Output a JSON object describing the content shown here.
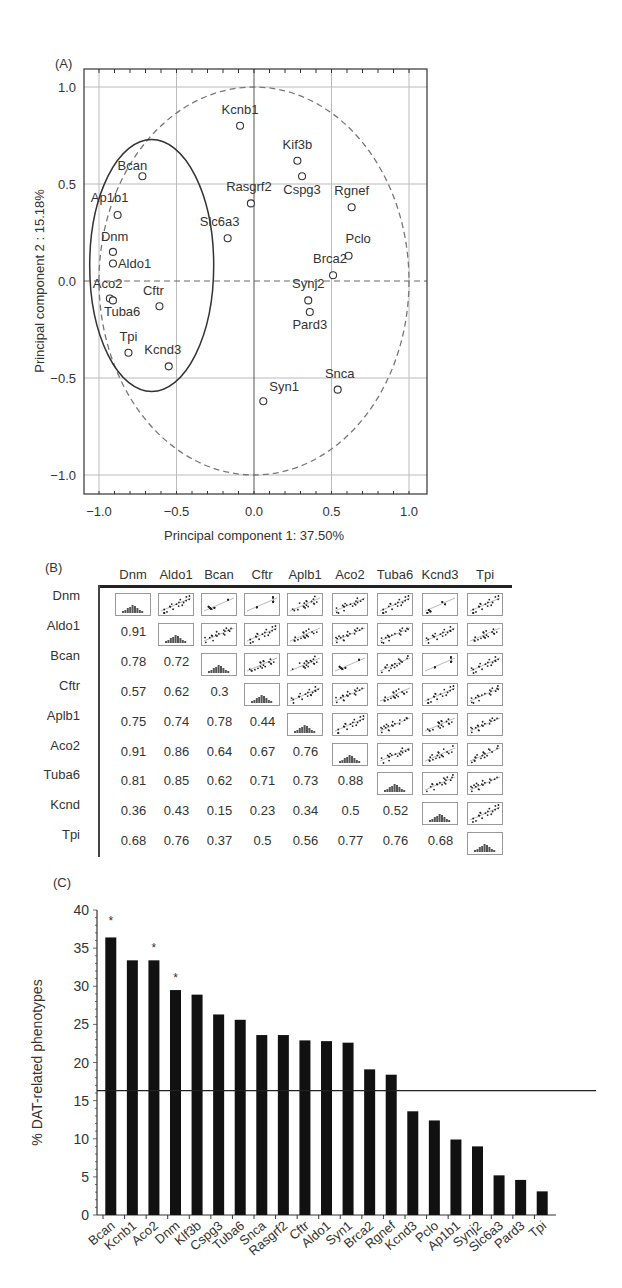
{
  "panels": {
    "a_label": "(A)",
    "b_label": "(B)",
    "c_label": "(C)"
  },
  "chart_data": [
    {
      "type": "scatter",
      "panel": "(A)",
      "title": "",
      "xlabel": "Principal component 1: 37.50%",
      "ylabel": "Principal component 2 : 15.18%",
      "xlim": [
        -1.1,
        1.1
      ],
      "ylim": [
        -1.1,
        1.1
      ],
      "xticks": [
        "-1.0",
        "-0.5",
        "0.0",
        "0.5",
        "1.0"
      ],
      "yticks": [
        "1.0",
        "0.5",
        "0.0",
        "-0.5",
        "-1.0"
      ],
      "grid": true,
      "annotations": [
        "dashed unit circle",
        "solid ellipse around left cluster"
      ],
      "points": [
        {
          "label": "Kcnb1",
          "x": -0.09,
          "y": 0.8
        },
        {
          "label": "Kif3b",
          "x": 0.28,
          "y": 0.62
        },
        {
          "label": "Cspg3",
          "x": 0.31,
          "y": 0.54
        },
        {
          "label": "Bcan",
          "x": -0.72,
          "y": 0.54
        },
        {
          "label": "Rasgrf2",
          "x": -0.02,
          "y": 0.4
        },
        {
          "label": "Rgnef",
          "x": 0.63,
          "y": 0.38
        },
        {
          "label": "Ap1b1",
          "x": -0.88,
          "y": 0.34
        },
        {
          "label": "Slc6a3",
          "x": -0.17,
          "y": 0.22
        },
        {
          "label": "Dnm",
          "x": -0.91,
          "y": 0.15
        },
        {
          "label": "Pclo",
          "x": 0.61,
          "y": 0.13
        },
        {
          "label": "Aldo1",
          "x": -0.91,
          "y": 0.09
        },
        {
          "label": "Brca2",
          "x": 0.51,
          "y": 0.03
        },
        {
          "label": "Aco2",
          "x": -0.93,
          "y": -0.09
        },
        {
          "label": "Tuba6",
          "x": -0.91,
          "y": -0.1
        },
        {
          "label": "Synj2",
          "x": 0.35,
          "y": -0.1
        },
        {
          "label": "Cftr",
          "x": -0.61,
          "y": -0.13
        },
        {
          "label": "Pard3",
          "x": 0.36,
          "y": -0.16
        },
        {
          "label": "Tpi",
          "x": -0.81,
          "y": -0.37
        },
        {
          "label": "Kcnd3",
          "x": -0.55,
          "y": -0.44
        },
        {
          "label": "Snca",
          "x": 0.54,
          "y": -0.56
        },
        {
          "label": "Syn1",
          "x": 0.06,
          "y": -0.62
        }
      ]
    },
    {
      "type": "table",
      "panel": "(B)",
      "columns": [
        "Dnm",
        "Aldo1",
        "Bcan",
        "Cftr",
        "Aplb1",
        "Aco2",
        "Tuba6",
        "Kcnd3",
        "Tpi"
      ],
      "rows": [
        "Dnm",
        "Aldo1",
        "Bcan",
        "Cftr",
        "Aplb1",
        "Aco2",
        "Tuba6",
        "Kcnd",
        "Tpi"
      ],
      "lower_triangle": [
        [],
        [
          "0.91"
        ],
        [
          "0.78",
          "0.72"
        ],
        [
          "0.57",
          "0.62",
          "0.3"
        ],
        [
          "0.75",
          "0.74",
          "0.78",
          "0.44"
        ],
        [
          "0.91",
          "0.86",
          "0.64",
          "0.67",
          "0.76"
        ],
        [
          "0.81",
          "0.85",
          "0.62",
          "0.71",
          "0.73",
          "0.88"
        ],
        [
          "0.36",
          "0.43",
          "0.15",
          "0.23",
          "0.34",
          "0.5",
          "0.52"
        ],
        [
          "0.68",
          "0.76",
          "0.37",
          "0.5",
          "0.56",
          "0.77",
          "0.76",
          "0.68"
        ]
      ],
      "diagonal": "histogram thumbnails",
      "upper_triangle": "scatter-plot thumbnails with regression line"
    },
    {
      "type": "bar",
      "panel": "(C)",
      "title": "",
      "xlabel": "",
      "ylabel": "% DAT-related phenotypes",
      "ylim": [
        0,
        40
      ],
      "yticks": [
        "0",
        "5",
        "10",
        "15",
        "20",
        "25",
        "30",
        "35",
        "40"
      ],
      "categories": [
        "Bcan",
        "Kcnb1",
        "Aco2",
        "Dnm",
        "Klf3b",
        "Cspg3",
        "Tuba6",
        "Snca",
        "Rasgrf2",
        "Cftr",
        "Aldo1",
        "Syn1",
        "Brca2",
        "Rgnef",
        "Kcnd3",
        "Pclo",
        "Ap1b1",
        "Synj2",
        "Slc6a3",
        "Pard3",
        "Tpi"
      ],
      "values": [
        36.4,
        33.4,
        33.4,
        29.5,
        28.9,
        26.3,
        25.6,
        23.6,
        23.6,
        22.9,
        22.8,
        22.6,
        19.1,
        18.4,
        13.6,
        12.4,
        9.9,
        9.0,
        5.2,
        4.6,
        3.1
      ],
      "significant": [
        "Bcan",
        "Aco2",
        "Dnm"
      ],
      "significance_marker": "*",
      "threshold_line": 16.3,
      "grid": false
    }
  ]
}
